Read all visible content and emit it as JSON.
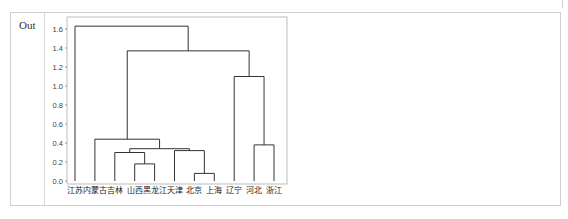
{
  "cell": {
    "prompt": "Out"
  },
  "chart_data": {
    "type": "dendrogram",
    "title": "",
    "xlabel": "",
    "ylabel": "",
    "ylim": [
      0.0,
      1.7
    ],
    "yticks": [
      "0.0",
      "0.2",
      "0.4",
      "0.6",
      "0.8",
      "1.0",
      "1.2",
      "1.4",
      "1.6"
    ],
    "leaves": [
      "江苏",
      "内蒙古",
      "吉林",
      "山西",
      "黑龙江",
      "天津",
      "北京",
      "上海",
      "辽宁",
      "河北",
      "浙江"
    ],
    "merges": [
      {
        "left": "北京",
        "right": "上海",
        "height": 0.08
      },
      {
        "left": "山西",
        "right": "黑龙江",
        "height": 0.18
      },
      {
        "left": "吉林",
        "right": "山西+黑龙江",
        "height": 0.3
      },
      {
        "left": "天津",
        "right": "北京+上海",
        "height": 0.32
      },
      {
        "left": "吉林+山西+黑龙江",
        "right": "天津+北京+上海",
        "height": 0.34
      },
      {
        "left": "河北",
        "right": "浙江",
        "height": 0.38
      },
      {
        "left": "内蒙古",
        "right": "吉林+山西+黑龙江+天津+北京+上海",
        "height": 0.44
      },
      {
        "left": "辽宁",
        "right": "河北+浙江",
        "height": 1.1
      },
      {
        "left": "内蒙古+...",
        "right": "辽宁+河北+浙江",
        "height": 1.37
      },
      {
        "left": "江苏",
        "right": "all others",
        "height": 1.63
      }
    ],
    "grid": false,
    "line_color": "#333333"
  }
}
